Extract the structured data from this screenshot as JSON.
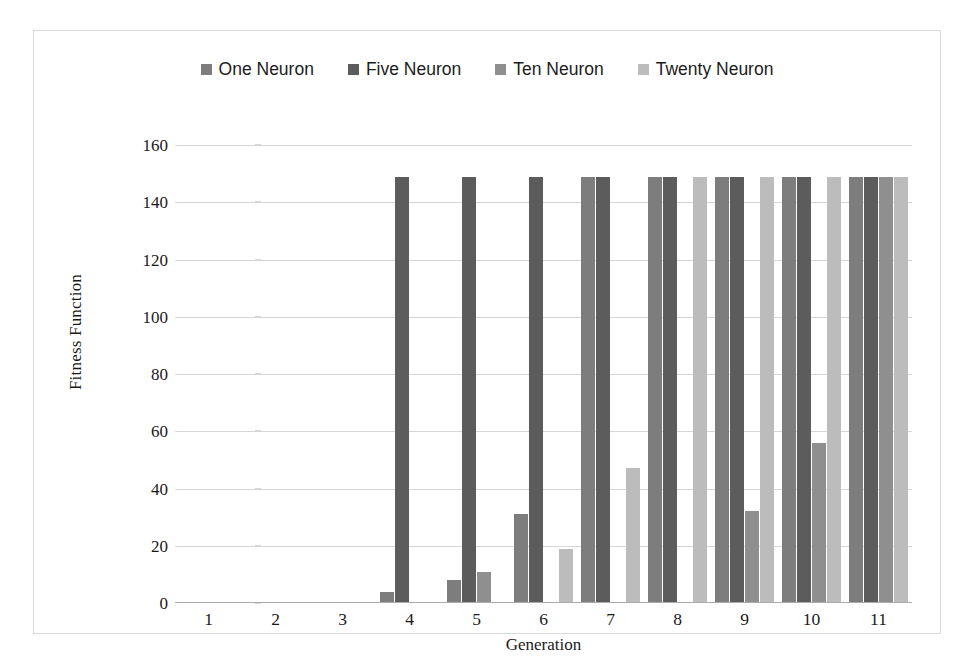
{
  "chart_data": {
    "type": "bar",
    "title": "",
    "xlabel": "Generation",
    "ylabel": "Fitness Function",
    "categories": [
      "1",
      "2",
      "3",
      "4",
      "5",
      "6",
      "7",
      "8",
      "9",
      "10",
      "11"
    ],
    "ylim": [
      0,
      160
    ],
    "yticks": [
      0,
      20,
      40,
      60,
      80,
      100,
      120,
      140,
      160
    ],
    "ytick_labels": [
      "0",
      "20",
      "40",
      "60",
      "80",
      "100",
      "120",
      "140",
      "160"
    ],
    "grid": true,
    "legend_position": "top-center",
    "series": [
      {
        "name": "One Neuron",
        "color": "#7d7d7d",
        "values": [
          0,
          0,
          0,
          4,
          8,
          31,
          149,
          149,
          149,
          149,
          149
        ]
      },
      {
        "name": "Five Neuron",
        "color": "#5c5c5c",
        "values": [
          0,
          0,
          0,
          149,
          149,
          149,
          149,
          149,
          149,
          149,
          149
        ]
      },
      {
        "name": "Ten Neuron",
        "color": "#8f8f8f",
        "values": [
          0,
          0,
          0,
          0,
          11,
          0,
          0,
          0,
          32,
          56,
          149
        ]
      },
      {
        "name": "Twenty Neuron",
        "color": "#bcbcbc",
        "values": [
          0,
          0,
          0,
          0,
          0,
          19,
          47,
          149,
          149,
          149,
          149
        ]
      }
    ]
  },
  "figure": {
    "border_color": "#d9d9d9",
    "background": "#ffffff",
    "gridline_color": "#d6d6d6"
  }
}
